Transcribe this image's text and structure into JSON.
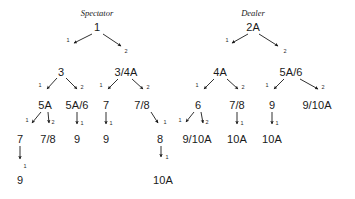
{
  "figure": {
    "background_color": "#ffffff",
    "ink_color": "#1a1a1a",
    "width": 355,
    "height": 199,
    "type": "two-decision-trees"
  },
  "trees": [
    {
      "name": "spectator-tree",
      "title": "Spectator",
      "title_x": 97,
      "title_y": 13
    },
    {
      "name": "dealer-tree",
      "title": "Dealer",
      "title_x": 253,
      "title_y": 13
    }
  ],
  "nodes": [
    {
      "id": "s0",
      "label": "1",
      "x": 97,
      "y": 27,
      "tree": "spectator"
    },
    {
      "id": "s1",
      "label": "3",
      "x": 61,
      "y": 72,
      "tree": "spectator"
    },
    {
      "id": "s2",
      "label": "3/4A",
      "x": 126,
      "y": 72,
      "tree": "spectator"
    },
    {
      "id": "s3",
      "label": "5A",
      "x": 45,
      "y": 105,
      "tree": "spectator"
    },
    {
      "id": "s4",
      "label": "5A/6",
      "x": 77,
      "y": 105,
      "tree": "spectator"
    },
    {
      "id": "s5",
      "label": "7",
      "x": 106,
      "y": 105,
      "tree": "spectator"
    },
    {
      "id": "s6",
      "label": "7/8",
      "x": 142,
      "y": 105,
      "tree": "spectator"
    },
    {
      "id": "s7",
      "label": "7",
      "x": 20,
      "y": 139,
      "tree": "spectator"
    },
    {
      "id": "s8",
      "label": "7/8",
      "x": 48,
      "y": 139,
      "tree": "spectator"
    },
    {
      "id": "s9",
      "label": "9",
      "x": 77,
      "y": 139,
      "tree": "spectator"
    },
    {
      "id": "s10",
      "label": "9",
      "x": 106,
      "y": 139,
      "tree": "spectator"
    },
    {
      "id": "s11",
      "label": "8",
      "x": 160,
      "y": 139,
      "tree": "spectator"
    },
    {
      "id": "s12",
      "label": "9",
      "x": 20,
      "y": 180,
      "tree": "spectator"
    },
    {
      "id": "s13",
      "label": "10A",
      "x": 163,
      "y": 180,
      "tree": "spectator"
    },
    {
      "id": "d0",
      "label": "2A",
      "x": 253,
      "y": 27,
      "tree": "dealer"
    },
    {
      "id": "d1",
      "label": "4A",
      "x": 220,
      "y": 72,
      "tree": "dealer"
    },
    {
      "id": "d2",
      "label": "5A/6",
      "x": 291,
      "y": 72,
      "tree": "dealer"
    },
    {
      "id": "d3",
      "label": "6",
      "x": 198,
      "y": 105,
      "tree": "dealer"
    },
    {
      "id": "d4",
      "label": "7/8",
      "x": 237,
      "y": 105,
      "tree": "dealer"
    },
    {
      "id": "d5",
      "label": "9",
      "x": 272,
      "y": 105,
      "tree": "dealer"
    },
    {
      "id": "d6",
      "label": "9/10A",
      "x": 317,
      "y": 105,
      "tree": "dealer"
    },
    {
      "id": "d7",
      "label": "9/10A",
      "x": 197,
      "y": 139,
      "tree": "dealer"
    },
    {
      "id": "d8",
      "label": "10A",
      "x": 237,
      "y": 139,
      "tree": "dealer"
    },
    {
      "id": "d9",
      "label": "10A",
      "x": 272,
      "y": 139,
      "tree": "dealer"
    }
  ],
  "edges": [
    {
      "from": "s0",
      "to": "s1",
      "label": "1",
      "lx": 68,
      "ly": 41,
      "x1": 92,
      "y1": 34,
      "x2": 74,
      "y2": 43
    },
    {
      "from": "s0",
      "to": "s2",
      "label": "2",
      "lx": 126,
      "ly": 52,
      "x1": 103,
      "y1": 34,
      "x2": 121,
      "y2": 46
    },
    {
      "from": "s1",
      "to": "s3",
      "label": "1",
      "lx": 40,
      "ly": 86,
      "x1": 57,
      "y1": 78,
      "x2": 47,
      "y2": 89
    },
    {
      "from": "s1",
      "to": "s4",
      "label": "2",
      "lx": 82,
      "ly": 88,
      "x1": 66,
      "y1": 78,
      "x2": 77,
      "y2": 89
    },
    {
      "from": "s2",
      "to": "s5",
      "label": "1",
      "lx": 101,
      "ly": 86,
      "x1": 118,
      "y1": 79,
      "x2": 108,
      "y2": 89
    },
    {
      "from": "s2",
      "to": "s6",
      "label": "2",
      "lx": 148,
      "ly": 88,
      "x1": 132,
      "y1": 79,
      "x2": 143,
      "y2": 89
    },
    {
      "from": "s3",
      "to": "s7",
      "label": "1",
      "lx": 27,
      "ly": 121,
      "x1": 41,
      "y1": 112,
      "x2": 32,
      "y2": 123
    },
    {
      "from": "s3",
      "to": "s8",
      "label": "2",
      "lx": 53,
      "ly": 123,
      "x1": 48,
      "y1": 112,
      "x2": 49,
      "y2": 123
    },
    {
      "from": "s4",
      "to": "s9",
      "label": "1",
      "lx": 82,
      "ly": 124,
      "x1": 77,
      "y1": 112,
      "x2": 77,
      "y2": 124
    },
    {
      "from": "s5",
      "to": "s10",
      "label": "1",
      "lx": 111,
      "ly": 124,
      "x1": 106,
      "y1": 112,
      "x2": 106,
      "y2": 124
    },
    {
      "from": "s6",
      "to": "s11",
      "label": "1",
      "lx": 165,
      "ly": 123,
      "x1": 151,
      "y1": 112,
      "x2": 158,
      "y2": 123
    },
    {
      "from": "s7",
      "to": "s12",
      "label": "1",
      "lx": 25,
      "ly": 167,
      "x1": 20,
      "y1": 146,
      "x2": 20,
      "y2": 159
    },
    {
      "from": "s11",
      "to": "s13",
      "label": "1",
      "lx": 167,
      "ly": 158,
      "x1": 161,
      "y1": 146,
      "x2": 161,
      "y2": 157
    },
    {
      "from": "d0",
      "to": "d1",
      "label": "1",
      "lx": 227,
      "ly": 41,
      "x1": 248,
      "y1": 34,
      "x2": 232,
      "y2": 43
    },
    {
      "from": "d0",
      "to": "d2",
      "label": "2",
      "lx": 285,
      "ly": 52,
      "x1": 259,
      "y1": 34,
      "x2": 278,
      "y2": 46
    },
    {
      "from": "d1",
      "to": "d3",
      "label": "1",
      "lx": 197,
      "ly": 86,
      "x1": 214,
      "y1": 79,
      "x2": 204,
      "y2": 89
    },
    {
      "from": "d1",
      "to": "d4",
      "label": "2",
      "lx": 243,
      "ly": 88,
      "x1": 227,
      "y1": 79,
      "x2": 238,
      "y2": 89
    },
    {
      "from": "d2",
      "to": "d5",
      "label": "1",
      "lx": 267,
      "ly": 86,
      "x1": 284,
      "y1": 79,
      "x2": 274,
      "y2": 89
    },
    {
      "from": "d2",
      "to": "d6",
      "label": "2",
      "lx": 323,
      "ly": 88,
      "x1": 300,
      "y1": 79,
      "x2": 318,
      "y2": 89
    },
    {
      "from": "d3",
      "to": "d7",
      "label": "1",
      "lx": 180,
      "ly": 121,
      "x1": 194,
      "y1": 112,
      "x2": 186,
      "y2": 122
    },
    {
      "from": "d3",
      "to": "d7b",
      "label": "2",
      "lx": 207,
      "ly": 123,
      "x1": 201,
      "y1": 112,
      "x2": 203,
      "y2": 123
    },
    {
      "from": "d4",
      "to": "d8",
      "label": "1",
      "lx": 242,
      "ly": 124,
      "x1": 237,
      "y1": 112,
      "x2": 237,
      "y2": 124
    },
    {
      "from": "d5",
      "to": "d9",
      "label": "1",
      "lx": 277,
      "ly": 124,
      "x1": 272,
      "y1": 112,
      "x2": 272,
      "y2": 124
    }
  ]
}
